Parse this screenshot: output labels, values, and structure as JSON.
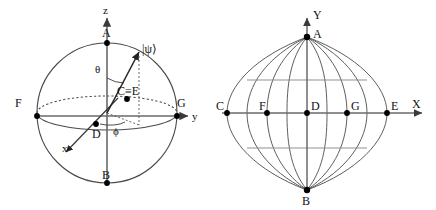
{
  "figure": {
    "name": "bloch-sphere-and-sinusoidal-projection",
    "background_color": "#ffffff",
    "stroke_color": "#3a3a3a",
    "dot_color": "#000000",
    "text_color": "#111111"
  },
  "left_panel": {
    "name": "bloch-sphere",
    "axes": [
      {
        "id": "z",
        "label": "z",
        "direction": "up"
      },
      {
        "id": "y",
        "label": "y",
        "direction": "right"
      },
      {
        "id": "x",
        "label": "x",
        "direction": "down-left"
      }
    ],
    "angles": [
      {
        "id": "theta",
        "label": "θ"
      },
      {
        "id": "phi",
        "label": "ϕ"
      }
    ],
    "state_vector_label": "|ψ⟩",
    "points": [
      {
        "id": "A",
        "label": "A",
        "position": "north-pole"
      },
      {
        "id": "B",
        "label": "B",
        "position": "south-pole"
      },
      {
        "id": "F",
        "label": "F",
        "position": "equator-left"
      },
      {
        "id": "G",
        "label": "G",
        "position": "equator-right"
      },
      {
        "id": "CE",
        "label": "C≡E",
        "position": "on-sphere-upper-right"
      },
      {
        "id": "D",
        "label": "D",
        "position": "below-center"
      }
    ]
  },
  "right_panel": {
    "name": "sinusoidal-projection",
    "axes": [
      {
        "id": "Y",
        "label": "Y",
        "direction": "up"
      },
      {
        "id": "X",
        "label": "X",
        "direction": "right"
      }
    ],
    "points": [
      {
        "id": "A",
        "label": "A",
        "position": "north-pole"
      },
      {
        "id": "B",
        "label": "B",
        "position": "south-pole"
      },
      {
        "id": "C",
        "label": "C",
        "position": "x-axis-far-left"
      },
      {
        "id": "F",
        "label": "F",
        "position": "x-axis-left"
      },
      {
        "id": "D",
        "label": "D",
        "position": "x-axis-origin"
      },
      {
        "id": "G",
        "label": "G",
        "position": "x-axis-right"
      },
      {
        "id": "E",
        "label": "E",
        "position": "x-axis-far-right"
      }
    ],
    "grid": {
      "meridian_count": 9,
      "latitude_lines": 3,
      "latitude_labels": [
        "upper",
        "equator",
        "lower"
      ]
    }
  }
}
